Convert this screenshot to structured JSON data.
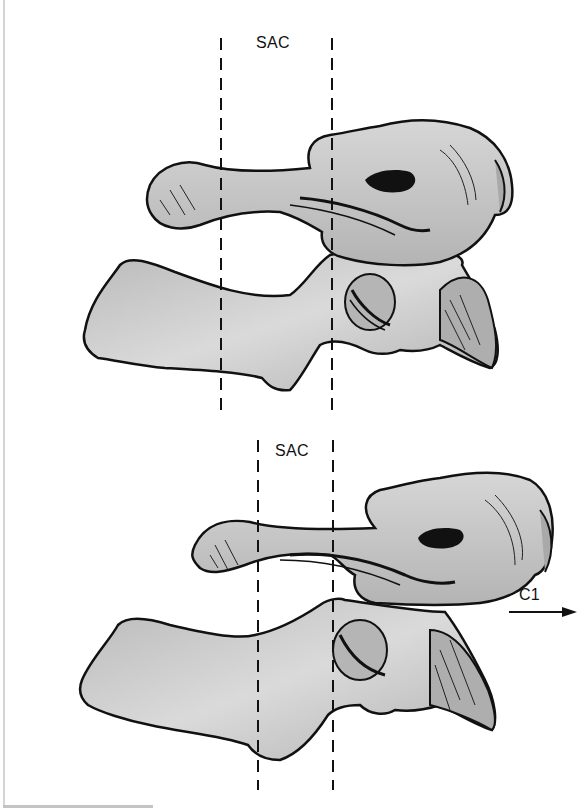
{
  "figure": {
    "panels": [
      {
        "id": "top",
        "label": "SAC",
        "description": "Neutral alignment of C1 over C2"
      },
      {
        "id": "bottom",
        "label": "SAC",
        "description": "Anterior displacement of C1 on C2 narrowing the SAC",
        "arrow_label": "C1",
        "arrow_direction": "right"
      }
    ],
    "colors": {
      "bone_fill": "#c9c9c9",
      "bone_shade": "#a8a8a8",
      "outline": "#111111",
      "background": "#ffffff",
      "guide_lines": "#111111"
    }
  }
}
